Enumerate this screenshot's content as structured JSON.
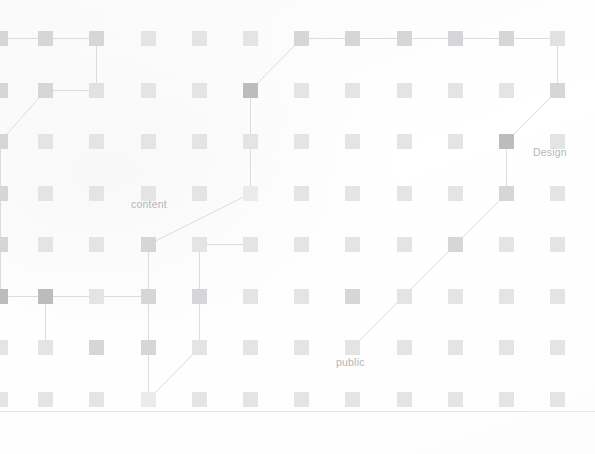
{
  "canvas": {
    "width": 595,
    "height": 454,
    "background": "#ffffff"
  },
  "palette": {
    "node_default": "#d6d6d8",
    "node_dark": "#bcbcbf",
    "node_light": "#e2e2e0",
    "node_faint": "#e4e4e5",
    "node_pale": "#ebebe9",
    "edge": "#dcdcdc",
    "label_text": "#b4b4b6",
    "rule": "#e6e6e6"
  },
  "grid": {
    "columns": 12,
    "rows": 8,
    "node_size": 15,
    "col_x": [
      -7,
      38,
      89,
      141,
      192,
      243,
      294,
      345,
      397,
      448,
      499,
      550
    ],
    "row_y": [
      31,
      83,
      134,
      186,
      237,
      289,
      340,
      392
    ]
  },
  "labels": [
    {
      "text": "content",
      "x": 131,
      "y": 198,
      "name": "label-content"
    },
    {
      "text": "Design",
      "x": 533,
      "y": 146,
      "name": "label-design"
    },
    {
      "text": "public",
      "x": 336,
      "y": 356,
      "name": "label-public"
    }
  ],
  "nodes": [
    {
      "id": "n0-0",
      "col": 0,
      "row": 0,
      "tone": "default"
    },
    {
      "id": "n0-1",
      "col": 1,
      "row": 0,
      "tone": "default"
    },
    {
      "id": "n0-2",
      "col": 2,
      "row": 0,
      "tone": "default"
    },
    {
      "id": "n0-3",
      "col": 3,
      "row": 0,
      "tone": "faint"
    },
    {
      "id": "n0-4",
      "col": 4,
      "row": 0,
      "tone": "faint"
    },
    {
      "id": "n0-5",
      "col": 5,
      "row": 0,
      "tone": "faint"
    },
    {
      "id": "n0-6",
      "col": 6,
      "row": 0,
      "tone": "default"
    },
    {
      "id": "n0-7",
      "col": 7,
      "row": 0,
      "tone": "default"
    },
    {
      "id": "n0-8",
      "col": 8,
      "row": 0,
      "tone": "default"
    },
    {
      "id": "n0-9",
      "col": 9,
      "row": 0,
      "tone": "default"
    },
    {
      "id": "n0-10",
      "col": 10,
      "row": 0,
      "tone": "default"
    },
    {
      "id": "n0-11",
      "col": 11,
      "row": 0,
      "tone": "light"
    },
    {
      "id": "n1-0",
      "col": 0,
      "row": 1,
      "tone": "default"
    },
    {
      "id": "n1-1",
      "col": 1,
      "row": 1,
      "tone": "default"
    },
    {
      "id": "n1-2",
      "col": 2,
      "row": 1,
      "tone": "light"
    },
    {
      "id": "n1-3",
      "col": 3,
      "row": 1,
      "tone": "faint"
    },
    {
      "id": "n1-4",
      "col": 4,
      "row": 1,
      "tone": "faint"
    },
    {
      "id": "n1-5",
      "col": 5,
      "row": 1,
      "tone": "dark"
    },
    {
      "id": "n1-6",
      "col": 6,
      "row": 1,
      "tone": "faint"
    },
    {
      "id": "n1-7",
      "col": 7,
      "row": 1,
      "tone": "faint"
    },
    {
      "id": "n1-8",
      "col": 8,
      "row": 1,
      "tone": "faint"
    },
    {
      "id": "n1-9",
      "col": 9,
      "row": 1,
      "tone": "faint"
    },
    {
      "id": "n1-10",
      "col": 10,
      "row": 1,
      "tone": "faint"
    },
    {
      "id": "n1-11",
      "col": 11,
      "row": 1,
      "tone": "default"
    },
    {
      "id": "n2-0",
      "col": 0,
      "row": 2,
      "tone": "default"
    },
    {
      "id": "n2-1",
      "col": 1,
      "row": 2,
      "tone": "faint"
    },
    {
      "id": "n2-2",
      "col": 2,
      "row": 2,
      "tone": "faint"
    },
    {
      "id": "n2-3",
      "col": 3,
      "row": 2,
      "tone": "faint"
    },
    {
      "id": "n2-4",
      "col": 4,
      "row": 2,
      "tone": "faint"
    },
    {
      "id": "n2-5",
      "col": 5,
      "row": 2,
      "tone": "faint"
    },
    {
      "id": "n2-6",
      "col": 6,
      "row": 2,
      "tone": "faint"
    },
    {
      "id": "n2-7",
      "col": 7,
      "row": 2,
      "tone": "faint"
    },
    {
      "id": "n2-8",
      "col": 8,
      "row": 2,
      "tone": "faint"
    },
    {
      "id": "n2-9",
      "col": 9,
      "row": 2,
      "tone": "faint"
    },
    {
      "id": "n2-10",
      "col": 10,
      "row": 2,
      "tone": "dark"
    },
    {
      "id": "n2-11",
      "col": 11,
      "row": 2,
      "tone": "faint"
    },
    {
      "id": "n3-0",
      "col": 0,
      "row": 3,
      "tone": "default"
    },
    {
      "id": "n3-1",
      "col": 1,
      "row": 3,
      "tone": "faint"
    },
    {
      "id": "n3-2",
      "col": 2,
      "row": 3,
      "tone": "faint"
    },
    {
      "id": "n3-3",
      "col": 3,
      "row": 3,
      "tone": "faint"
    },
    {
      "id": "n3-4",
      "col": 4,
      "row": 3,
      "tone": "faint"
    },
    {
      "id": "n3-5",
      "col": 5,
      "row": 3,
      "tone": "pale"
    },
    {
      "id": "n3-6",
      "col": 6,
      "row": 3,
      "tone": "faint"
    },
    {
      "id": "n3-7",
      "col": 7,
      "row": 3,
      "tone": "faint"
    },
    {
      "id": "n3-8",
      "col": 8,
      "row": 3,
      "tone": "faint"
    },
    {
      "id": "n3-9",
      "col": 9,
      "row": 3,
      "tone": "faint"
    },
    {
      "id": "n3-10",
      "col": 10,
      "row": 3,
      "tone": "default"
    },
    {
      "id": "n3-11",
      "col": 11,
      "row": 3,
      "tone": "faint"
    },
    {
      "id": "n4-0",
      "col": 0,
      "row": 4,
      "tone": "default"
    },
    {
      "id": "n4-1",
      "col": 1,
      "row": 4,
      "tone": "faint"
    },
    {
      "id": "n4-2",
      "col": 2,
      "row": 4,
      "tone": "faint"
    },
    {
      "id": "n4-3",
      "col": 3,
      "row": 4,
      "tone": "default"
    },
    {
      "id": "n4-4",
      "col": 4,
      "row": 4,
      "tone": "faint"
    },
    {
      "id": "n4-5",
      "col": 5,
      "row": 4,
      "tone": "faint"
    },
    {
      "id": "n4-6",
      "col": 6,
      "row": 4,
      "tone": "faint"
    },
    {
      "id": "n4-7",
      "col": 7,
      "row": 4,
      "tone": "faint"
    },
    {
      "id": "n4-8",
      "col": 8,
      "row": 4,
      "tone": "faint"
    },
    {
      "id": "n4-9",
      "col": 9,
      "row": 4,
      "tone": "default"
    },
    {
      "id": "n4-10",
      "col": 10,
      "row": 4,
      "tone": "faint"
    },
    {
      "id": "n4-11",
      "col": 11,
      "row": 4,
      "tone": "faint"
    },
    {
      "id": "n5-0",
      "col": 0,
      "row": 5,
      "tone": "dark"
    },
    {
      "id": "n5-1",
      "col": 1,
      "row": 5,
      "tone": "dark"
    },
    {
      "id": "n5-2",
      "col": 2,
      "row": 5,
      "tone": "faint"
    },
    {
      "id": "n5-3",
      "col": 3,
      "row": 5,
      "tone": "default"
    },
    {
      "id": "n5-4",
      "col": 4,
      "row": 5,
      "tone": "default"
    },
    {
      "id": "n5-5",
      "col": 5,
      "row": 5,
      "tone": "faint"
    },
    {
      "id": "n5-6",
      "col": 6,
      "row": 5,
      "tone": "faint"
    },
    {
      "id": "n5-7",
      "col": 7,
      "row": 5,
      "tone": "default"
    },
    {
      "id": "n5-8",
      "col": 8,
      "row": 5,
      "tone": "faint"
    },
    {
      "id": "n5-9",
      "col": 9,
      "row": 5,
      "tone": "faint"
    },
    {
      "id": "n5-10",
      "col": 10,
      "row": 5,
      "tone": "faint"
    },
    {
      "id": "n5-11",
      "col": 11,
      "row": 5,
      "tone": "faint"
    },
    {
      "id": "n6-0",
      "col": 0,
      "row": 6,
      "tone": "faint"
    },
    {
      "id": "n6-1",
      "col": 1,
      "row": 6,
      "tone": "faint"
    },
    {
      "id": "n6-2",
      "col": 2,
      "row": 6,
      "tone": "default"
    },
    {
      "id": "n6-3",
      "col": 3,
      "row": 6,
      "tone": "default"
    },
    {
      "id": "n6-4",
      "col": 4,
      "row": 6,
      "tone": "faint"
    },
    {
      "id": "n6-5",
      "col": 5,
      "row": 6,
      "tone": "faint"
    },
    {
      "id": "n6-6",
      "col": 6,
      "row": 6,
      "tone": "faint"
    },
    {
      "id": "n6-7",
      "col": 7,
      "row": 6,
      "tone": "faint"
    },
    {
      "id": "n6-8",
      "col": 8,
      "row": 6,
      "tone": "faint"
    },
    {
      "id": "n6-9",
      "col": 9,
      "row": 6,
      "tone": "faint"
    },
    {
      "id": "n6-10",
      "col": 10,
      "row": 6,
      "tone": "faint"
    },
    {
      "id": "n6-11",
      "col": 11,
      "row": 6,
      "tone": "faint"
    },
    {
      "id": "n7-0",
      "col": 0,
      "row": 7,
      "tone": "faint"
    },
    {
      "id": "n7-1",
      "col": 1,
      "row": 7,
      "tone": "faint"
    },
    {
      "id": "n7-2",
      "col": 2,
      "row": 7,
      "tone": "faint"
    },
    {
      "id": "n7-3",
      "col": 3,
      "row": 7,
      "tone": "pale"
    },
    {
      "id": "n7-4",
      "col": 4,
      "row": 7,
      "tone": "faint"
    },
    {
      "id": "n7-5",
      "col": 5,
      "row": 7,
      "tone": "faint"
    },
    {
      "id": "n7-6",
      "col": 6,
      "row": 7,
      "tone": "faint"
    },
    {
      "id": "n7-7",
      "col": 7,
      "row": 7,
      "tone": "faint"
    },
    {
      "id": "n7-8",
      "col": 8,
      "row": 7,
      "tone": "faint"
    },
    {
      "id": "n7-9",
      "col": 9,
      "row": 7,
      "tone": "faint"
    },
    {
      "id": "n7-10",
      "col": 10,
      "row": 7,
      "tone": "faint"
    },
    {
      "id": "n7-11",
      "col": 11,
      "row": 7,
      "tone": "faint"
    }
  ],
  "edges": [
    {
      "from": "n0-0",
      "to": "n0-1"
    },
    {
      "from": "n0-1",
      "to": "n0-2"
    },
    {
      "from": "n0-2",
      "to": "n1-2"
    },
    {
      "from": "n1-1",
      "to": "n1-2"
    },
    {
      "from": "n1-1",
      "to": "n2-0"
    },
    {
      "from": "n2-0",
      "to": "n3-0"
    },
    {
      "from": "n0-6",
      "to": "n0-7"
    },
    {
      "from": "n0-7",
      "to": "n0-8"
    },
    {
      "from": "n0-8",
      "to": "n0-9"
    },
    {
      "from": "n0-9",
      "to": "n0-10"
    },
    {
      "from": "n0-10",
      "to": "n0-11"
    },
    {
      "from": "n0-6",
      "to": "n1-5"
    },
    {
      "from": "n1-5",
      "to": "n3-5"
    },
    {
      "from": "n3-5",
      "to": "n4-3"
    },
    {
      "from": "n4-3",
      "to": "n5-3"
    },
    {
      "from": "n0-11",
      "to": "n1-11"
    },
    {
      "from": "n1-11",
      "to": "n2-10"
    },
    {
      "from": "n2-10",
      "to": "n3-10"
    },
    {
      "from": "n3-10",
      "to": "n4-9"
    },
    {
      "from": "n4-9",
      "to": "n6-7"
    },
    {
      "from": "n3-0",
      "to": "n4-0"
    },
    {
      "from": "n4-0",
      "to": "n5-0"
    },
    {
      "from": "n5-0",
      "to": "n5-1"
    },
    {
      "from": "n5-1",
      "to": "n6-1"
    },
    {
      "from": "n5-1",
      "to": "n5-2"
    },
    {
      "from": "n5-2",
      "to": "n5-3"
    },
    {
      "from": "n5-3",
      "to": "n6-3"
    },
    {
      "from": "n6-3",
      "to": "n7-3"
    },
    {
      "from": "n5-4",
      "to": "n4-4"
    },
    {
      "from": "n5-4",
      "to": "n6-4"
    },
    {
      "from": "n6-4",
      "to": "n7-3"
    },
    {
      "from": "n4-4",
      "to": "n4-5"
    }
  ],
  "rules": [
    {
      "y": 411,
      "x": 0,
      "width": 595,
      "name": "baseline-rule"
    }
  ]
}
